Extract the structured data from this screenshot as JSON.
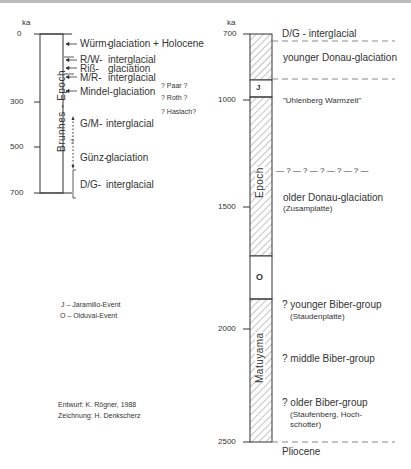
{
  "unit": "ka",
  "left_scale": {
    "ticks": [
      "0",
      "300",
      "500",
      "700"
    ],
    "epoch_label": "Brunhes - Epoch",
    "entries": [
      {
        "code": "Würm-",
        "name": "glaciation + Holocene"
      },
      {
        "code": "R/W-",
        "name": "interglacial"
      },
      {
        "code": "Riß-",
        "name": "glaciation"
      },
      {
        "code": "M/R-",
        "name": "interglacial"
      },
      {
        "code": "Mindel-",
        "name": "glaciation"
      },
      {
        "code": "G/M-",
        "name": "interglacial"
      },
      {
        "code": "Günz-",
        "name": "glaciation"
      },
      {
        "code": "D/G-",
        "name": "interglacial"
      }
    ],
    "uncertain": [
      "? Paar ?",
      "? Roth ?",
      "? Haslach?"
    ],
    "question_mark": "?"
  },
  "right_scale": {
    "ticks": [
      "700",
      "1000",
      "1500",
      "2000",
      "2500"
    ],
    "epoch_label_upper": "Epoch",
    "epoch_label_lower": "Matuyama",
    "event_j": "J",
    "event_o": "O",
    "entries": {
      "dg": "D/G - interglacial",
      "younger_donau": "younger Donau-glaciation",
      "uhlenberg": "\"Uhlenberg Warmzeit\"",
      "uncertain_line": "— ? — ? — ? — ? — ? —",
      "older_donau": "older Donau-glaciation",
      "older_donau_sub": "(Zusamplatte)",
      "younger_biber": "? younger Biber-group",
      "younger_biber_sub": "(Staudenplatte)",
      "middle_biber": "? middle Biber-group",
      "older_biber": "? older Biber-group",
      "older_biber_sub1": "(Staufenberg, Hoch-",
      "older_biber_sub2": "schotter)",
      "pliocene": "Pliocene"
    }
  },
  "legend": {
    "j": "J – Jaramillo-Event",
    "o": "O – Olduvai-Event"
  },
  "credits": {
    "design": "Entwurf: K. Rögner, 1988",
    "drawing": "Zeichnung: H. Denkscherz"
  }
}
